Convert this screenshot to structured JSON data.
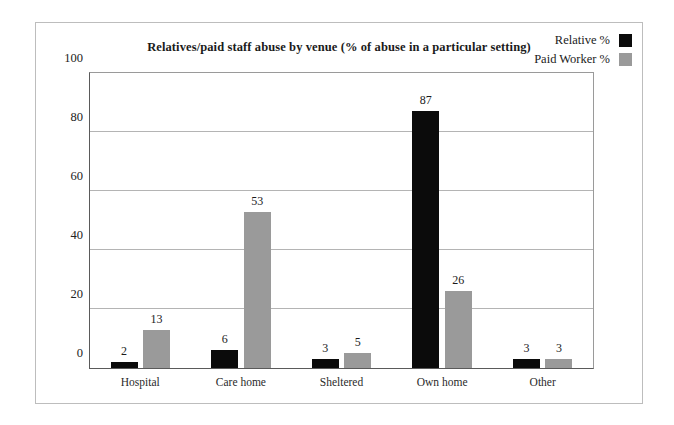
{
  "chart_data": {
    "type": "bar",
    "title": "Relatives/paid staff abuse by venue (% of abuse in a particular setting)",
    "categories": [
      "Hospital",
      "Care home",
      "Sheltered",
      "Own home",
      "Other"
    ],
    "series": [
      {
        "name": "Relative %",
        "color": "#0b0b0b",
        "values": [
          2,
          6,
          3,
          87,
          3
        ]
      },
      {
        "name": "Paid Worker %",
        "color": "#9a9a9a",
        "values": [
          13,
          53,
          5,
          26,
          3
        ]
      }
    ],
    "xlabel": "",
    "ylabel": "",
    "ylim": [
      0,
      100
    ],
    "yticks": [
      0,
      20,
      40,
      60,
      80,
      100
    ],
    "ytick_labels": [
      "0",
      "20",
      "40",
      "60",
      "80",
      "100"
    ],
    "grid": true,
    "legend_position": "top-right"
  }
}
